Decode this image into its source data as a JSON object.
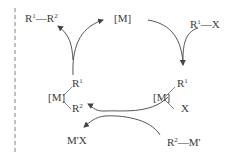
{
  "diagram": {
    "type": "catalytic-cycle",
    "catalyst": "[M]",
    "reactant_1": {
      "base": "R",
      "sup": "1",
      "suffix": "—X"
    },
    "reactant_2": {
      "base": "R",
      "sup": "2",
      "suffix": "—M'"
    },
    "product": {
      "p1": "R",
      "s1": "1",
      "mid": "—R",
      "s2": "2"
    },
    "byproduct": "M'X",
    "intermediate_oa": {
      "metal": "[M]",
      "top": "R",
      "top_sup": "1",
      "bottom": "X"
    },
    "intermediate_tm": {
      "metal": "[M]",
      "top": "R",
      "top_sup": "1",
      "bottom": "R",
      "bottom_sup": "2"
    },
    "colors": {
      "line": "#555555",
      "dash": "#aaaaaa",
      "text": "#3a3a3a"
    }
  }
}
